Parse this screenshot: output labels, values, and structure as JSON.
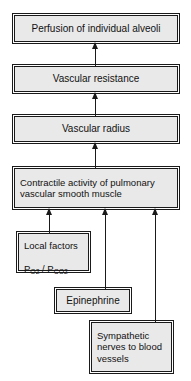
{
  "diagram": {
    "background_color": "#ffffff",
    "node_fill_color": "#e9e9e9",
    "node_border_color": "#1a1a1a",
    "connector_color": "#1a1a1a",
    "type": "flowchart",
    "direction": "bottom-to-top",
    "nodes": [
      {
        "id": "perfusion",
        "label": "Perfusion of individual alveoli"
      },
      {
        "id": "resistance",
        "label": "Vascular resistance"
      },
      {
        "id": "radius",
        "label": "Vascular radius"
      },
      {
        "id": "contractile",
        "label": "Contractile activity of pulmonary vascular smooth muscle"
      },
      {
        "id": "local",
        "label_line1": "Local factors",
        "label_line2_prefix": "P",
        "label_line2_sub1": "O2",
        "label_line2_mid": " / P",
        "label_line2_sub2": "CO2"
      },
      {
        "id": "epinephrine",
        "label": "Epinephrine"
      },
      {
        "id": "sympathetic",
        "label": "Sympathetic nerves to blood vessels"
      }
    ],
    "edges": [
      {
        "from": "resistance",
        "to": "perfusion",
        "style": "arrow"
      },
      {
        "from": "radius",
        "to": "resistance",
        "style": "arrow"
      },
      {
        "from": "contractile",
        "to": "radius",
        "style": "arrow"
      },
      {
        "from": "local",
        "to": "contractile",
        "style": "arrow"
      },
      {
        "from": "epinephrine",
        "to": "contractile",
        "style": "arrow"
      },
      {
        "from": "sympathetic",
        "to": "contractile",
        "style": "arrow"
      }
    ]
  }
}
